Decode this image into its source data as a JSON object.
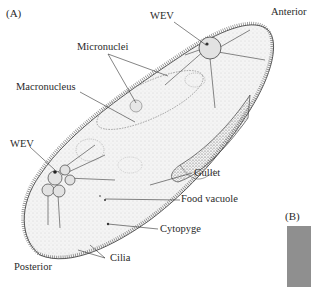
{
  "panels": {
    "a": "(A)",
    "b": "(B)"
  },
  "labels": {
    "anterior": "Anterior",
    "posterior": "Posterior",
    "wev_top": "WEV",
    "wev_bottom": "WEV",
    "micronuclei": "Micronuclei",
    "macronucleus": "Macronucleus",
    "gullet": "Gullet",
    "food_vacuole": "Food vacuole",
    "cytopyge": "Cytopyge",
    "cilia": "Cilia"
  },
  "colors": {
    "background": "#ffffff",
    "ink": "#2a2a2a",
    "cell_fill": "#f2f2f2",
    "panel_b_fill": "#8f8f8f"
  }
}
